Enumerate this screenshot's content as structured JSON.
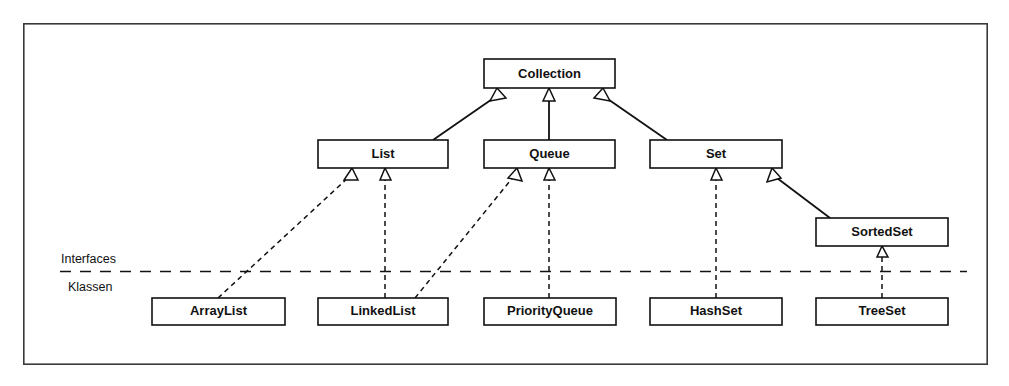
{
  "diagram": {
    "frame": {
      "x": 23,
      "y": 23,
      "width": 965,
      "height": 342
    },
    "colors": {
      "background": "#ffffff",
      "stroke": "#111111",
      "frame_stroke": "#3a3a3a",
      "box_fill": "#ffffff"
    },
    "layer_labels": [
      {
        "id": "interfaces",
        "text": "Interfaces",
        "x": 61,
        "y": 263
      },
      {
        "id": "klassen",
        "text": "Klassen",
        "x": 68,
        "y": 291
      }
    ],
    "separator": {
      "y": 271,
      "x1": 60,
      "x2": 967,
      "style": "dashed"
    },
    "interfaces": [
      {
        "id": "collection",
        "label": "Collection",
        "x": 484,
        "y": 59,
        "width": 131,
        "height": 29
      },
      {
        "id": "list",
        "label": "List",
        "x": 318,
        "y": 140,
        "width": 130,
        "height": 28
      },
      {
        "id": "queue",
        "label": "Queue",
        "x": 484,
        "y": 140,
        "width": 131,
        "height": 28
      },
      {
        "id": "set",
        "label": "Set",
        "x": 650,
        "y": 140,
        "width": 132,
        "height": 28
      },
      {
        "id": "sortedset",
        "label": "SortedSet",
        "x": 816,
        "y": 218,
        "width": 132,
        "height": 28
      }
    ],
    "classes": [
      {
        "id": "arraylist",
        "label": "ArrayList",
        "x": 152,
        "y": 298,
        "width": 133,
        "height": 27
      },
      {
        "id": "linkedlist",
        "label": "LinkedList",
        "x": 318,
        "y": 298,
        "width": 130,
        "height": 27
      },
      {
        "id": "priorityqueue",
        "label": "PriorityQueue",
        "x": 484,
        "y": 298,
        "width": 132,
        "height": 27
      },
      {
        "id": "hashset",
        "label": "HashSet",
        "x": 650,
        "y": 298,
        "width": 132,
        "height": 27
      },
      {
        "id": "treeset",
        "label": "TreeSet",
        "x": 816,
        "y": 298,
        "width": 132,
        "height": 27
      }
    ],
    "edges": [
      {
        "id": "list-to-collection",
        "from": "list",
        "to": "collection",
        "style": "solid",
        "relation": "generalization",
        "x1": 433,
        "y1": 140,
        "x2": 496,
        "y2": 88
      },
      {
        "id": "queue-to-collection",
        "from": "queue",
        "to": "collection",
        "style": "solid",
        "relation": "generalization",
        "x1": 549,
        "y1": 140,
        "x2": 549,
        "y2": 88
      },
      {
        "id": "set-to-collection",
        "from": "set",
        "to": "collection",
        "style": "solid",
        "relation": "generalization",
        "x1": 667,
        "y1": 140,
        "x2": 604,
        "y2": 88
      },
      {
        "id": "sortedset-to-set",
        "from": "sortedset",
        "to": "set",
        "style": "solid",
        "relation": "generalization",
        "x1": 830,
        "y1": 218,
        "x2": 771,
        "y2": 168
      },
      {
        "id": "arraylist-to-list",
        "from": "arraylist",
        "to": "list",
        "style": "dashed",
        "relation": "realization",
        "x1": 218,
        "y1": 298,
        "x2": 352,
        "y2": 168
      },
      {
        "id": "linkedlist-to-list",
        "from": "linkedlist",
        "to": "list",
        "style": "dashed",
        "relation": "realization",
        "x1": 385,
        "y1": 298,
        "x2": 385,
        "y2": 168
      },
      {
        "id": "linkedlist-to-queue",
        "from": "linkedlist",
        "to": "queue",
        "style": "dashed",
        "relation": "realization",
        "x1": 415,
        "y1": 298,
        "x2": 516,
        "y2": 168
      },
      {
        "id": "priorityqueue-to-queue",
        "from": "priorityqueue",
        "to": "queue",
        "style": "dashed",
        "relation": "realization",
        "x1": 549,
        "y1": 298,
        "x2": 549,
        "y2": 168
      },
      {
        "id": "hashset-to-set",
        "from": "hashset",
        "to": "set",
        "style": "dashed",
        "relation": "realization",
        "x1": 716,
        "y1": 298,
        "x2": 716,
        "y2": 168
      },
      {
        "id": "treeset-to-sortedset",
        "from": "treeset",
        "to": "sortedset",
        "style": "dashed",
        "relation": "realization",
        "x1": 882,
        "y1": 298,
        "x2": 882,
        "y2": 246
      }
    ]
  }
}
